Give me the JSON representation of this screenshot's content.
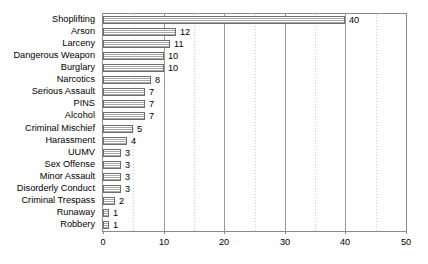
{
  "chart_data": {
    "type": "bar",
    "orientation": "horizontal",
    "title": "",
    "xlabel": "",
    "ylabel": "",
    "xlim": [
      0,
      50
    ],
    "xticks": [
      0,
      10,
      20,
      30,
      40,
      50
    ],
    "xtick_labels": [
      "0",
      "10",
      "20",
      "30",
      "40",
      "50"
    ],
    "minor_xticks": [
      5,
      15,
      25,
      35,
      45
    ],
    "grid": {
      "major_vertical": true,
      "minor_vertical": true,
      "horizontal": false
    },
    "legend": null,
    "data_labels": true,
    "categories": [
      "Shoplifting",
      "Arson",
      "Larceny",
      "Dangerous Weapon",
      "Burglary",
      "Narcotics",
      "Serious Assault",
      "PINS",
      "Alcohol",
      "Criminal Mischief",
      "Harassment",
      "UUMV",
      "Sex Offense",
      "Minor Assault",
      "Disorderly Conduct",
      "Criminal Trespass",
      "Runaway",
      "Robbery"
    ],
    "values": [
      40,
      12,
      11,
      10,
      10,
      8,
      7,
      7,
      7,
      5,
      4,
      3,
      3,
      3,
      3,
      2,
      1,
      1
    ],
    "value_labels": [
      "40",
      "12",
      "11",
      "10",
      "10",
      "8",
      "7",
      "7",
      "7",
      "5",
      "4",
      "3",
      "3",
      "3",
      "3",
      "2",
      "1",
      "1"
    ],
    "colors": {
      "bar_fill": "#b4b4b4",
      "bar_border": "#6e6e6e",
      "gridline_major": "#9a9a9a",
      "gridline_minor": "#cfcfcf",
      "plot_border": "#8a8a8a",
      "text": "#000000",
      "background": "#ffffff"
    }
  }
}
